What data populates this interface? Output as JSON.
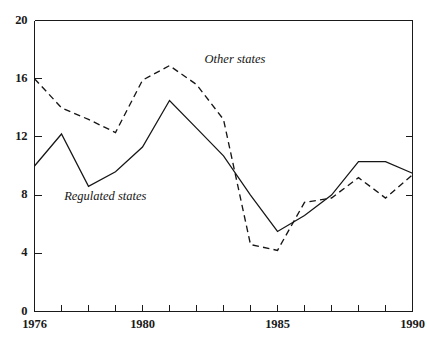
{
  "chart_data": {
    "type": "line",
    "title": "",
    "subtitle": "",
    "xlabel": "",
    "ylabel": "",
    "xlim": [
      1976,
      1990
    ],
    "ylim": [
      0,
      20
    ],
    "grid": false,
    "legend_position": "inline-annotations",
    "x": [
      1976,
      1977,
      1978,
      1979,
      1980,
      1981,
      1982,
      1983,
      1984,
      1985,
      1986,
      1987,
      1988,
      1989,
      1990
    ],
    "y_ticks": [
      0,
      4,
      8,
      12,
      16,
      20
    ],
    "y_tick_labels": [
      "0",
      "4",
      "8",
      "12",
      "16",
      "20"
    ],
    "x_ticks": [
      1976,
      1977,
      1978,
      1979,
      1980,
      1981,
      1982,
      1983,
      1984,
      1985,
      1986,
      1987,
      1988,
      1989,
      1990
    ],
    "x_tick_labels_shown": [
      "1976",
      "1980",
      "1985",
      "1990"
    ],
    "x_labeled_values": [
      1976,
      1980,
      1985,
      1990
    ],
    "series": [
      {
        "name": "Regulated states",
        "style": "solid",
        "label": "Regulated states",
        "values": [
          10.0,
          12.2,
          8.6,
          9.6,
          11.3,
          14.5,
          12.6,
          10.7,
          8.0,
          5.5,
          6.6,
          8.0,
          10.3,
          10.3,
          9.5
        ]
      },
      {
        "name": "Other states",
        "style": "dashed",
        "label": "Other states",
        "values": [
          16.0,
          14.0,
          13.2,
          12.3,
          15.9,
          16.9,
          15.6,
          13.2,
          4.6,
          4.2,
          7.5,
          7.8,
          9.2,
          7.8,
          9.4
        ]
      }
    ],
    "annotations": [
      {
        "text": "Other states",
        "x": 1982.3,
        "y": 17.3
      },
      {
        "text": "Regulated states",
        "x": 1977.1,
        "y": 7.9
      }
    ]
  },
  "colors": {
    "line": "#161616",
    "axis": "#1a1a1a",
    "background": "#ffffff"
  }
}
